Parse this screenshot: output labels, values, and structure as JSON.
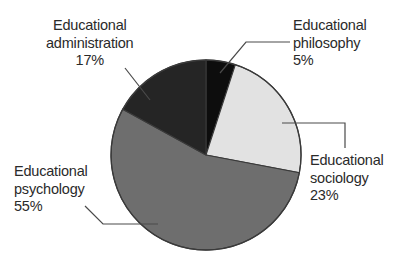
{
  "chart_data": {
    "type": "pie",
    "title": "",
    "subtitle": "",
    "xlabel": "",
    "ylabel": "",
    "legend_position": "callout-labels",
    "grid": false,
    "start_angle_deg": 0,
    "direction": "clockwise",
    "categories": [
      "Educational philosophy",
      "Educational sociology",
      "Educational psychology",
      "Educational administration"
    ],
    "values": [
      5,
      23,
      55,
      17
    ],
    "value_unit": "%",
    "colors": [
      "#0d0d0d",
      "#e2e2e2",
      "#6e6e6e",
      "#252525"
    ],
    "slices": [
      {
        "name": "Educational philosophy",
        "label_line1": "Educational",
        "label_line2": "philosophy",
        "percent_text": "5%",
        "value": 5,
        "color": "#0d0d0d"
      },
      {
        "name": "Educational sociology",
        "label_line1": "Educational",
        "label_line2": "sociology",
        "percent_text": "23%",
        "value": 23,
        "color": "#e2e2e2"
      },
      {
        "name": "Educational psychology",
        "label_line1": "Educational",
        "label_line2": "psychology",
        "percent_text": "55%",
        "value": 55,
        "color": "#6e6e6e"
      },
      {
        "name": "Educational administration",
        "label_line1": "Educational",
        "label_line2": "administration",
        "percent_text": "17%",
        "value": 17,
        "color": "#252525"
      }
    ]
  },
  "style": {
    "background": "#ffffff",
    "text_color": "#2a2a2a",
    "outline_color": "#3a3a3a",
    "leader_color": "#4a4a4a"
  }
}
